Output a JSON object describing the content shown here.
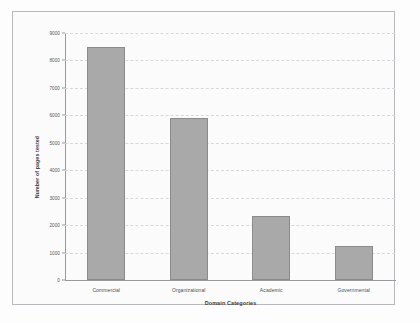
{
  "chart_data": {
    "type": "bar",
    "title": "",
    "xlabel": "Domain Categories",
    "ylabel": "Number of pages tested",
    "categories": [
      "Commercial",
      "Organizational",
      "Academic",
      "Governmental"
    ],
    "values": [
      8500,
      5900,
      2350,
      1250
    ],
    "ylim": [
      0,
      9000
    ],
    "yticks": [
      0,
      1000,
      2000,
      3000,
      4000,
      5000,
      6000,
      7000,
      8000,
      9000
    ],
    "ytick_labels": [
      "0",
      "1000",
      "2000",
      "3000",
      "4000",
      "5000",
      "6000",
      "7000",
      "8000",
      "9000"
    ],
    "grid": true,
    "grid_axis": "y",
    "legend": false,
    "colors": {
      "bar_fill": "#a9a9a9",
      "bar_border": "#8b8b8b",
      "gridline": "#d7d7dd",
      "axis": "#9a9a9e",
      "frame": "#b9b9bd",
      "plot_background": "#fbfbfb",
      "text": "#3c3c42"
    }
  }
}
